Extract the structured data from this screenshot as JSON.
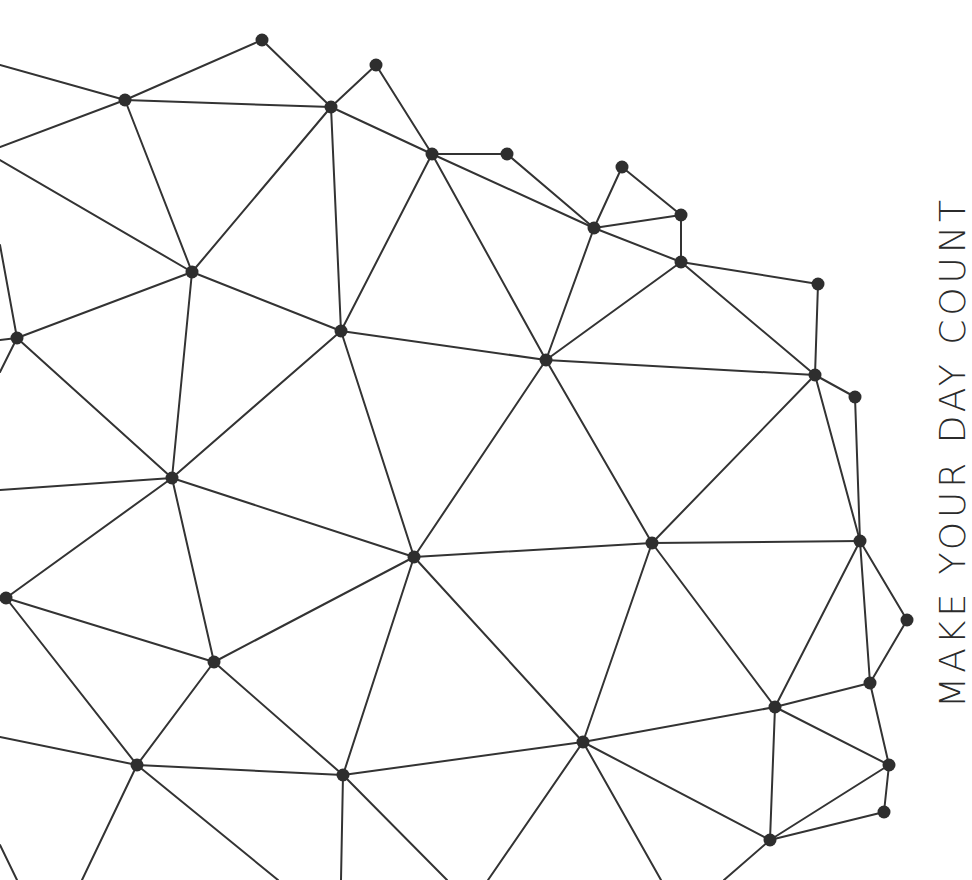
{
  "poster": {
    "tagline": "MAKE YOUR DAY COUNT",
    "background_color": "#ffffff",
    "line_color": "#333333",
    "node_color": "#2e2e2e",
    "text_color": "#2b2b2b"
  },
  "network": {
    "node_radius": 6.5,
    "line_width": 2,
    "nodes": [
      {
        "id": "n1",
        "x": 262,
        "y": 40
      },
      {
        "id": "n2",
        "x": 376,
        "y": 65
      },
      {
        "id": "n3",
        "x": 125,
        "y": 100
      },
      {
        "id": "n4",
        "x": 331,
        "y": 107
      },
      {
        "id": "n5",
        "x": 432,
        "y": 154
      },
      {
        "id": "n6",
        "x": 507,
        "y": 154
      },
      {
        "id": "n7",
        "x": 622,
        "y": 167
      },
      {
        "id": "n8",
        "x": 681,
        "y": 215
      },
      {
        "id": "n9",
        "x": 594,
        "y": 228
      },
      {
        "id": "n10",
        "x": 681,
        "y": 262
      },
      {
        "id": "n11",
        "x": 192,
        "y": 272
      },
      {
        "id": "n12",
        "x": 818,
        "y": 284
      },
      {
        "id": "n13",
        "x": 341,
        "y": 331
      },
      {
        "id": "n14",
        "x": 17,
        "y": 338
      },
      {
        "id": "n15",
        "x": 546,
        "y": 360
      },
      {
        "id": "n16",
        "x": 815,
        "y": 375
      },
      {
        "id": "n17",
        "x": 855,
        "y": 397
      },
      {
        "id": "n18",
        "x": 172,
        "y": 478
      },
      {
        "id": "n19",
        "x": 860,
        "y": 541
      },
      {
        "id": "n20",
        "x": 652,
        "y": 543
      },
      {
        "id": "n21",
        "x": 414,
        "y": 557
      },
      {
        "id": "n22",
        "x": 6,
        "y": 598
      },
      {
        "id": "n23",
        "x": 907,
        "y": 620
      },
      {
        "id": "n24",
        "x": 214,
        "y": 662
      },
      {
        "id": "n25",
        "x": 870,
        "y": 683
      },
      {
        "id": "n26",
        "x": 775,
        "y": 707
      },
      {
        "id": "n27",
        "x": 583,
        "y": 742
      },
      {
        "id": "n28",
        "x": 137,
        "y": 765
      },
      {
        "id": "n29",
        "x": 889,
        "y": 765
      },
      {
        "id": "n30",
        "x": 343,
        "y": 775
      },
      {
        "id": "n31",
        "x": 884,
        "y": 812
      },
      {
        "id": "n32",
        "x": 770,
        "y": 840
      }
    ],
    "edges": [
      [
        "n1",
        "n3"
      ],
      [
        "n1",
        "n4"
      ],
      [
        "n3",
        "n4"
      ],
      [
        "n2",
        "n4"
      ],
      [
        "n2",
        "n5"
      ],
      [
        "n4",
        "n5"
      ],
      [
        "n4",
        "n11"
      ],
      [
        "n4",
        "n13"
      ],
      [
        "n3",
        "n11"
      ],
      [
        "n5",
        "n6"
      ],
      [
        "n5",
        "n9"
      ],
      [
        "n5",
        "n13"
      ],
      [
        "n5",
        "n15"
      ],
      [
        "n6",
        "n9"
      ],
      [
        "n7",
        "n9"
      ],
      [
        "n7",
        "n8"
      ],
      [
        "n8",
        "n9"
      ],
      [
        "n8",
        "n10"
      ],
      [
        "n9",
        "n10"
      ],
      [
        "n9",
        "n15"
      ],
      [
        "n10",
        "n15"
      ],
      [
        "n10",
        "n12"
      ],
      [
        "n10",
        "n16"
      ],
      [
        "n12",
        "n16"
      ],
      [
        "n15",
        "n16"
      ],
      [
        "n16",
        "n17"
      ],
      [
        "n16",
        "n19"
      ],
      [
        "n16",
        "n20"
      ],
      [
        "n17",
        "n19"
      ],
      [
        "n11",
        "n14"
      ],
      [
        "n11",
        "n13"
      ],
      [
        "n11",
        "n18"
      ],
      [
        "n13",
        "n15"
      ],
      [
        "n13",
        "n18"
      ],
      [
        "n13",
        "n21"
      ],
      [
        "n14",
        "n18"
      ],
      [
        "n15",
        "n21"
      ],
      [
        "n15",
        "n20"
      ],
      [
        "n18",
        "n21"
      ],
      [
        "n18",
        "n22"
      ],
      [
        "n18",
        "n24"
      ],
      [
        "n20",
        "n21"
      ],
      [
        "n19",
        "n20"
      ],
      [
        "n19",
        "n23"
      ],
      [
        "n19",
        "n25"
      ],
      [
        "n19",
        "n26"
      ],
      [
        "n20",
        "n26"
      ],
      [
        "n20",
        "n27"
      ],
      [
        "n21",
        "n24"
      ],
      [
        "n21",
        "n30"
      ],
      [
        "n21",
        "n27"
      ],
      [
        "n22",
        "n24"
      ],
      [
        "n22",
        "n28"
      ],
      [
        "n24",
        "n28"
      ],
      [
        "n24",
        "n30"
      ],
      [
        "n23",
        "n25"
      ],
      [
        "n25",
        "n26"
      ],
      [
        "n25",
        "n29"
      ],
      [
        "n26",
        "n27"
      ],
      [
        "n26",
        "n29"
      ],
      [
        "n26",
        "n32"
      ],
      [
        "n27",
        "n30"
      ],
      [
        "n27",
        "n32"
      ],
      [
        "n28",
        "n30"
      ],
      [
        "n29",
        "n31"
      ],
      [
        "n29",
        "n32"
      ],
      [
        "n31",
        "n32"
      ]
    ],
    "edge_stubs": [
      {
        "from": [
          0,
          65
        ],
        "to": "n3"
      },
      {
        "from": [
          0,
          147
        ],
        "to": "n3"
      },
      {
        "from": [
          0,
          160
        ],
        "to": "n11"
      },
      {
        "from": [
          0,
          245
        ],
        "to": "n14"
      },
      {
        "from": [
          0,
          340
        ],
        "to": "n14"
      },
      {
        "from": [
          0,
          372
        ],
        "to": "n14"
      },
      {
        "from": [
          0,
          490
        ],
        "to": "n18"
      },
      {
        "from": [
          0,
          737
        ],
        "to": "n28"
      },
      {
        "from": [
          0,
          845
        ],
        "to_point": [
          17,
          880
        ]
      },
      {
        "from": [
          82,
          880
        ],
        "to": "n28"
      },
      {
        "from": [
          278,
          880
        ],
        "to": "n28"
      },
      {
        "from": [
          341,
          880
        ],
        "to": "n30"
      },
      {
        "from": [
          447,
          880
        ],
        "to": "n30"
      },
      {
        "from": [
          488,
          880
        ],
        "to": "n27"
      },
      {
        "from": [
          661,
          880
        ],
        "to": "n27"
      },
      {
        "from": [
          724,
          880
        ],
        "to": "n32"
      }
    ]
  }
}
